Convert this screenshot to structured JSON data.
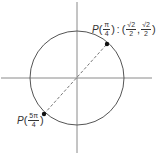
{
  "diagram": {
    "type": "unit-circle",
    "center": {
      "x": 77,
      "y": 78
    },
    "radius": 47,
    "colors": {
      "line": "#555555",
      "axis": "#888888",
      "dot": "#111111"
    },
    "axes": {
      "horizontal": {
        "x1": 1,
        "x2": 152,
        "y": 78
      },
      "vertical": {
        "x": 77,
        "y1": 2,
        "y2": 153
      }
    },
    "points": [
      {
        "id": "p-pi-4",
        "x": 107,
        "y": 44,
        "label": {
          "prefix": "P",
          "angle": {
            "num": "π",
            "den": "4"
          },
          "sep": ":",
          "coords": [
            {
              "num": "√2",
              "den": "2"
            },
            {
              "num": "√2",
              "den": "2"
            }
          ]
        }
      },
      {
        "id": "p-5pi-4",
        "x": 44,
        "y": 114,
        "label": {
          "prefix": "P",
          "angle": {
            "num": "5π",
            "den": "4"
          }
        }
      }
    ],
    "diameter": {
      "style": "dashed",
      "from": "p-5pi-4",
      "to": "p-pi-4"
    }
  }
}
